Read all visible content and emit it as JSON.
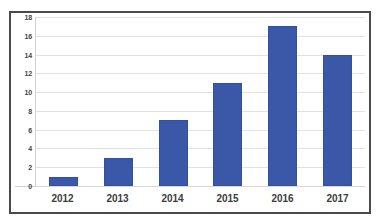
{
  "chart_data": {
    "type": "bar",
    "title": "",
    "subtitle": "",
    "xlabel": "",
    "ylabel": "",
    "categories": [
      "2012",
      "2013",
      "2014",
      "2015",
      "2016",
      "2017"
    ],
    "values": [
      1,
      3,
      7,
      11,
      17,
      14
    ],
    "series": [
      {
        "name": "",
        "values": [
          1,
          3,
          7,
          11,
          17,
          14
        ],
        "color": "#3a57a8"
      }
    ],
    "ylim": [
      0,
      18
    ],
    "y_tick_step": 2,
    "y_ticks": [
      "18",
      "16",
      "14",
      "12",
      "10",
      "8",
      "6",
      "4",
      "2",
      "0"
    ],
    "y_tick_values": [
      18,
      16,
      14,
      12,
      10,
      8,
      6,
      4,
      2,
      0
    ],
    "grid": true,
    "grid_axis": "y",
    "legend": false,
    "legend_position": "none",
    "annotations": [],
    "data_labels": false
  },
  "style": {
    "bar_color": "#3a57a8",
    "bar_border_color": "#32509f",
    "grid_color": "#e2e2e2",
    "axis_color": "#d2d2d2",
    "frame_color": "#4a4a4a",
    "tick_text_color": "#3f3f3f",
    "category_text_color": "#3c3c3c",
    "background": "#ffffff"
  }
}
